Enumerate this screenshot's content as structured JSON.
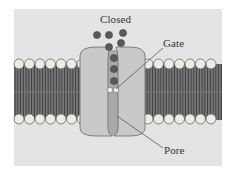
{
  "figure": {
    "title": "Closed",
    "labels": {
      "gate": "Gate",
      "pore": "Pore"
    },
    "colors": {
      "panel": "#e4e4e4",
      "protein": "#c9c9c9",
      "pore": "#a9a9a9",
      "ion": "#5a5a5a",
      "lipid_head": "#ecece4",
      "lipid_tail": "#4a4a4a",
      "outline": "#555555"
    }
  }
}
